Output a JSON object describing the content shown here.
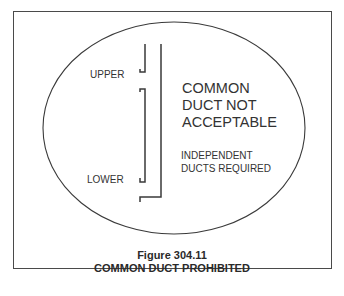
{
  "diagram": {
    "labels": {
      "upper": "UPPER",
      "lower": "LOWER",
      "main_line1": "COMMON",
      "main_line2": "DUCT NOT",
      "main_line3": "ACCEPTABLE",
      "sub_line1": "INDEPENDENT",
      "sub_line2": "DUCTS REQUIRED"
    },
    "caption": {
      "figure": "Figure 304.11",
      "title": "COMMON DUCT PROHIBITED"
    },
    "colors": {
      "line": "#3a3a3a",
      "frame": "#4a4a4a",
      "background": "#ffffff"
    }
  }
}
